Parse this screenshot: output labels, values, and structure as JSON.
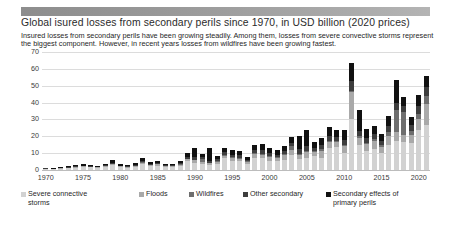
{
  "header": {
    "banner_color": "#9a9a9a",
    "title": "Global isured losses from secondary perils since 1970, in USD billion (2020 prices)",
    "subtitle": "Insured losses from secondary perils have been growing steadily. Among them, losses from severe convective storms represent the biggest component. However, in recent years losses from wildfires have been growing fastest."
  },
  "legend": {
    "items": [
      {
        "label": "Severe connective",
        "label2": "storms",
        "color": "#d2d2d2"
      },
      {
        "label": "Floods",
        "label2": "",
        "color": "#a9a9a9"
      },
      {
        "label": "Wildfires",
        "label2": "",
        "color": "#6e6e6e"
      },
      {
        "label": "Other secondary",
        "label2": "",
        "color": "#3d3d3d"
      },
      {
        "label": "Secondary effects of",
        "label2": "primary perils",
        "color": "#111111"
      }
    ]
  },
  "chart_data": {
    "type": "bar",
    "stacked": true,
    "title": "Global isured losses from secondary perils since 1970, in USD billion (2020 prices)",
    "xlabel": "",
    "ylabel": "",
    "ylim": [
      0,
      70
    ],
    "yticks": [
      0,
      10,
      20,
      30,
      40,
      50,
      60,
      70
    ],
    "grid": true,
    "legend_position": "bottom",
    "xticks": [
      "1970",
      "1975",
      "1980",
      "1985",
      "1990",
      "1995",
      "2000",
      "2005",
      "2010",
      "2015",
      "2020"
    ],
    "x": [
      1970,
      1971,
      1972,
      1973,
      1974,
      1975,
      1976,
      1977,
      1978,
      1979,
      1980,
      1981,
      1982,
      1983,
      1984,
      1985,
      1986,
      1987,
      1988,
      1989,
      1990,
      1991,
      1992,
      1993,
      1994,
      1995,
      1996,
      1997,
      1998,
      1999,
      2000,
      2001,
      2002,
      2003,
      2004,
      2005,
      2006,
      2007,
      2008,
      2009,
      2010,
      2011,
      2012,
      2013,
      2014,
      2015,
      2016,
      2017,
      2018,
      2019,
      2020,
      2021
    ],
    "series": [
      {
        "name": "Severe connective storms",
        "color": "#d2d2d2",
        "values": [
          0.5,
          0.4,
          0.7,
          0.9,
          1.4,
          1.6,
          1.5,
          1.2,
          1.7,
          2.8,
          1.6,
          1.3,
          1.9,
          3.5,
          2.4,
          2.6,
          1.6,
          1.6,
          2.4,
          5.1,
          4.3,
          3.4,
          3.0,
          3.5,
          7.0,
          5.6,
          5.2,
          3.6,
          7.3,
          7.0,
          5.6,
          5.3,
          5.8,
          9.2,
          6.6,
          7.2,
          8.3,
          7.0,
          13.0,
          13.4,
          10.2,
          30.0,
          14.8,
          11.0,
          12.6,
          10.0,
          15.0,
          17.0,
          16.5,
          16.0,
          24.0,
          27.0
        ]
      },
      {
        "name": "Floods",
        "color": "#a9a9a9",
        "values": [
          0.2,
          0.2,
          0.3,
          0.4,
          0.4,
          0.5,
          0.4,
          0.4,
          0.5,
          0.7,
          0.5,
          0.4,
          0.6,
          0.9,
          0.7,
          0.7,
          0.5,
          0.5,
          0.8,
          1.3,
          1.5,
          1.2,
          1.1,
          1.3,
          1.6,
          1.7,
          1.6,
          1.2,
          2.0,
          2.2,
          2.0,
          1.8,
          3.2,
          2.4,
          2.6,
          3.5,
          2.4,
          4.0,
          3.6,
          3.2,
          4.0,
          16.0,
          4.0,
          4.4,
          4.6,
          3.4,
          5.0,
          5.5,
          4.2,
          5.0,
          6.5,
          12.0
        ]
      },
      {
        "name": "Wildfires",
        "color": "#6e6e6e",
        "values": [
          0.05,
          0.05,
          0.05,
          0.1,
          0.1,
          0.1,
          0.1,
          0.1,
          0.1,
          0.15,
          0.1,
          0.1,
          0.15,
          0.2,
          0.15,
          0.2,
          0.15,
          0.15,
          0.2,
          0.3,
          0.4,
          1.8,
          0.3,
          0.4,
          0.5,
          0.4,
          0.5,
          0.4,
          0.6,
          0.6,
          0.6,
          0.5,
          0.7,
          2.4,
          0.6,
          0.7,
          0.6,
          1.4,
          0.8,
          0.7,
          0.7,
          0.9,
          1.4,
          0.9,
          1.0,
          1.2,
          2.6,
          13.0,
          13.5,
          2.2,
          3.0,
          5.0
        ]
      },
      {
        "name": "Other secondary",
        "color": "#3d3d3d",
        "values": [
          0.2,
          0.2,
          0.3,
          0.3,
          0.4,
          0.5,
          0.4,
          0.3,
          0.5,
          0.8,
          0.5,
          0.4,
          0.6,
          0.9,
          0.6,
          0.7,
          0.5,
          0.5,
          0.8,
          1.2,
          1.6,
          1.1,
          1.2,
          1.1,
          1.5,
          1.5,
          1.4,
          1.0,
          1.8,
          2.0,
          1.8,
          1.6,
          1.7,
          2.0,
          2.4,
          2.6,
          2.0,
          2.4,
          3.0,
          2.4,
          3.0,
          6.0,
          3.2,
          3.0,
          3.2,
          2.6,
          3.4,
          4.0,
          3.6,
          3.4,
          4.2,
          5.5
        ]
      },
      {
        "name": "Secondary effects of primary perils",
        "color": "#111111",
        "values": [
          0.3,
          0.3,
          0.4,
          0.6,
          0.7,
          0.9,
          0.8,
          0.6,
          0.9,
          1.4,
          0.9,
          0.7,
          1.1,
          1.6,
          1.1,
          1.2,
          0.9,
          0.9,
          1.4,
          2.2,
          5.0,
          2.0,
          7.5,
          2.0,
          2.6,
          2.8,
          2.5,
          1.8,
          3.2,
          3.8,
          3.2,
          2.8,
          3.0,
          3.6,
          8.0,
          9.5,
          3.6,
          4.2,
          5.4,
          4.3,
          5.6,
          10.5,
          12.0,
          4.8,
          4.8,
          4.4,
          6.0,
          14.0,
          5.4,
          4.6,
          7.0,
          6.0
        ]
      }
    ]
  }
}
